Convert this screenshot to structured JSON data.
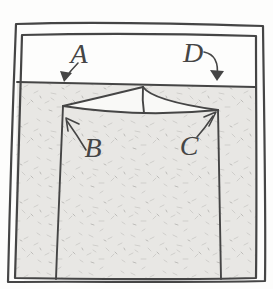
{
  "labels": {
    "a": "A",
    "b": "B",
    "c": "C",
    "d": "D"
  },
  "colors": {
    "ink": "#454545",
    "liquid": "#e8e7e4",
    "paper": "#fdfdfc",
    "rim_gap": "#f9f9f7",
    "speckle": "#cfcecb",
    "speckle_dark": "#bdbcb9"
  }
}
